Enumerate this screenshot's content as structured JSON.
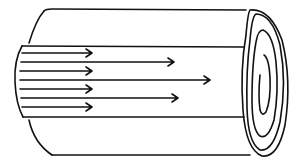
{
  "diagram": {
    "colors": {
      "stroke": "#111111",
      "background": "#ffffff"
    },
    "outer_cylinder": {
      "top_y": 10,
      "bottom_y": 155,
      "left_x": 30,
      "right_x": 245
    },
    "inner_layer": {
      "top_y": 46,
      "bottom_y": 117,
      "left_x": 17
    },
    "short_arrows": [
      {
        "y": 53,
        "x1": 22,
        "x2": 92
      },
      {
        "y": 71,
        "x1": 20,
        "x2": 92
      },
      {
        "y": 89,
        "x1": 20,
        "x2": 92
      },
      {
        "y": 107,
        "x1": 22,
        "x2": 92
      }
    ],
    "long_arrows": [
      {
        "y": 62,
        "x1": 21,
        "x2": 174
      },
      {
        "y": 80,
        "x1": 20,
        "x2": 210
      },
      {
        "y": 98,
        "x1": 21,
        "x2": 178
      }
    ],
    "end_cap": {
      "cx": 266,
      "cy": 83,
      "rings": 3,
      "has_spiral": true
    }
  }
}
